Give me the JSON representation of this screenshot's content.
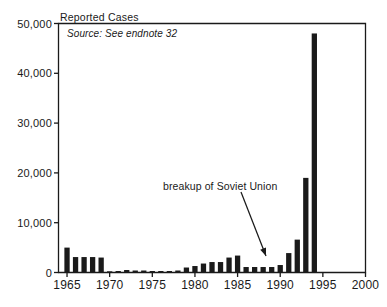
{
  "chart_data": {
    "type": "bar",
    "title": "Reported Cases",
    "subtitle": "Source: See endnote 32",
    "xlabel": "",
    "ylabel": "",
    "xlim": [
      1964,
      2000
    ],
    "ylim": [
      0,
      50000
    ],
    "grid": false,
    "legend": null,
    "ytick_labels": [
      "0",
      "10,000",
      "20,000",
      "30,000",
      "40,000",
      "50,000"
    ],
    "ytick_values": [
      0,
      10000,
      20000,
      30000,
      40000,
      50000
    ],
    "xtick_labels": [
      "1965",
      "1970",
      "1975",
      "1980",
      "1985",
      "1990",
      "1995",
      "2000"
    ],
    "xtick_values": [
      1965,
      1970,
      1975,
      1980,
      1985,
      1990,
      1995,
      2000
    ],
    "bar_color": "#1a1a1a",
    "categories": [
      1965,
      1966,
      1967,
      1968,
      1969,
      1970,
      1971,
      1972,
      1973,
      1974,
      1975,
      1976,
      1977,
      1978,
      1979,
      1980,
      1981,
      1982,
      1983,
      1984,
      1985,
      1986,
      1987,
      1988,
      1989,
      1990,
      1991,
      1992,
      1993,
      1994
    ],
    "values": [
      5000,
      3100,
      3100,
      3100,
      3000,
      200,
      300,
      500,
      400,
      400,
      300,
      300,
      300,
      400,
      1000,
      1300,
      1800,
      2100,
      2100,
      3000,
      3400,
      1100,
      1100,
      1100,
      1100,
      1500,
      3900,
      6600,
      19000,
      48000
    ],
    "annotations": [
      {
        "text": "breakup of Soviet Union",
        "points_to_year": 1990,
        "arrow": true
      }
    ]
  },
  "axis": {
    "spine_color": "#1a1a1a",
    "tick_color": "#1a1a1a"
  }
}
